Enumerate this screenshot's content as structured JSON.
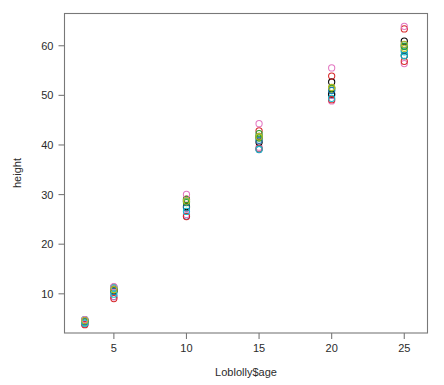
{
  "figure": {
    "type": "scatter-plot",
    "background_color": "#ffffff",
    "frame_color": "#787878",
    "text_color": "#2b2b2b"
  },
  "axes": {
    "x_title": "Loblolly$age",
    "y_title": "height",
    "x_ticks": [
      "5",
      "10",
      "15",
      "20",
      "25"
    ],
    "y_ticks": [
      "10",
      "20",
      "30",
      "40",
      "50",
      "60"
    ]
  },
  "chart_data": {
    "type": "scatter",
    "title": "",
    "xlabel": "Loblolly$age",
    "ylabel": "height",
    "xlim": [
      1.6,
      26.6
    ],
    "ylim": [
      2.1,
      66.5
    ],
    "x_ticks": [
      5,
      10,
      15,
      20,
      25
    ],
    "y_ticks": [
      10,
      20,
      30,
      40,
      50,
      60
    ],
    "grid": false,
    "legend": "none",
    "marker": "open-circle",
    "marker_size": 3.1,
    "x": [
      3,
      5,
      10,
      15,
      20,
      25
    ],
    "series": [
      {
        "name": "Seed 301",
        "color": "#000000",
        "values": [
          4.51,
          10.89,
          28.72,
          41.74,
          52.7,
          60.92
        ]
      },
      {
        "name": "Seed 303",
        "color": "#d62728",
        "values": [
          4.55,
          10.92,
          29.07,
          42.83,
          53.88,
          63.39
        ]
      },
      {
        "name": "Seed 305",
        "color": "#2ca02c",
        "values": [
          4.79,
          11.37,
          29.02,
          42.3,
          51.47,
          59.89
        ]
      },
      {
        "name": "Seed 307",
        "color": "#1f77b4",
        "values": [
          3.91,
          9.48,
          25.66,
          39.07,
          50.03,
          59.07
        ]
      },
      {
        "name": "Seed 309",
        "color": "#17becf",
        "values": [
          4.81,
          11.2,
          28.66,
          41.66,
          50.96,
          58.79
        ]
      },
      {
        "name": "Seed 311",
        "color": "#e377c2",
        "values": [
          3.88,
          9.4,
          25.99,
          39.55,
          48.87,
          56.4
        ]
      },
      {
        "name": "Seed 315",
        "color": "#bcbd22",
        "values": [
          4.32,
          10.43,
          27.39,
          41.52,
          51.26,
          59.49
        ]
      },
      {
        "name": "Seed 319",
        "color": "#000000",
        "values": [
          4.57,
          10.57,
          27.58,
          40.55,
          50.25,
          57.99
        ]
      },
      {
        "name": "Seed 321",
        "color": "#d62728",
        "values": [
          3.77,
          9.03,
          25.57,
          39.26,
          49.12,
          56.86
        ]
      },
      {
        "name": "Seed 323",
        "color": "#2ca02c",
        "values": [
          4.33,
          10.79,
          28.39,
          41.4,
          51.46,
          59.89
        ]
      },
      {
        "name": "Seed 325",
        "color": "#1f77b4",
        "values": [
          4.38,
          10.48,
          27.36,
          40.95,
          51.02,
          60.25
        ]
      },
      {
        "name": "Seed 327",
        "color": "#17becf",
        "values": [
          4.08,
          9.92,
          26.61,
          39.14,
          49.4,
          58.02
        ]
      },
      {
        "name": "Seed 329",
        "color": "#e377c2",
        "values": [
          4.81,
          11.44,
          30.03,
          44.29,
          55.53,
          63.91
        ]
      },
      {
        "name": "Seed 331",
        "color": "#bcbd22",
        "values": [
          4.61,
          10.86,
          28.72,
          41.66,
          51.62,
          60.28
        ]
      }
    ]
  }
}
